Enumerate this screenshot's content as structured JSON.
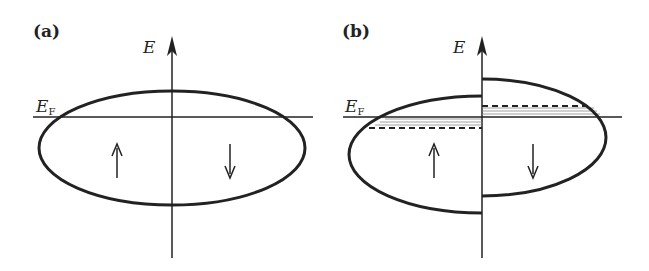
{
  "panels": [
    {
      "label": "(a)",
      "axis_label": "E",
      "fermi_label_main": "E",
      "fermi_label_sub": "F",
      "spin_up": "↑",
      "spin_down": "↓",
      "description": "Unpolarized density of states: symmetric spin-up and spin-down bands"
    },
    {
      "label": "(b)",
      "axis_label": "E",
      "fermi_label_main": "E",
      "fermi_label_sub": "F",
      "spin_up": "↑",
      "spin_down": "↓",
      "description": "Exchange-split density of states: spin-up band shifted down, spin-down band shifted up, with dashed original levels and shaded regions near E_F"
    }
  ],
  "colors": {
    "line": "#222222",
    "background": "#ffffff",
    "shade": "#999999"
  }
}
